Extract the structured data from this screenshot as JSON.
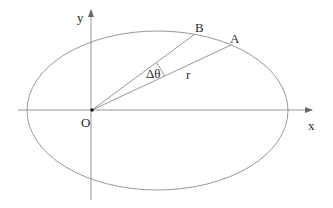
{
  "diagram": {
    "type": "elliptical-orbit-polar-sector",
    "colors": {
      "background": "#ffffff",
      "axis": "#8a8a8a",
      "ellipse": "#8c8c8c",
      "radius_lines": "#8c8c8c",
      "text": "#2a2a2a",
      "origin_point": "#1a1a1a"
    },
    "axes": {
      "x": {
        "label": "x",
        "from": [
          18,
          110
        ],
        "to": [
          312,
          110
        ]
      },
      "y": {
        "label": "y",
        "from": [
          91,
          200
        ],
        "to": [
          91,
          10
        ]
      }
    },
    "origin": {
      "label": "O",
      "point": [
        92,
        110
      ]
    },
    "ellipse": {
      "cx": 157.5,
      "cy": 110.5,
      "rx": 130.5,
      "ry": 79.5
    },
    "points": [
      {
        "label": "A",
        "position": [
          231,
          45
        ]
      },
      {
        "label": "B",
        "position": [
          195,
          34
        ]
      }
    ],
    "segments": [
      {
        "name": "OA",
        "label": "r",
        "from": "O",
        "to": "A"
      },
      {
        "name": "OB",
        "label": "",
        "from": "O",
        "to": "B"
      }
    ],
    "angle": {
      "label": "Δθ",
      "between": [
        "OA",
        "OB"
      ],
      "arc_radius": 80
    }
  }
}
